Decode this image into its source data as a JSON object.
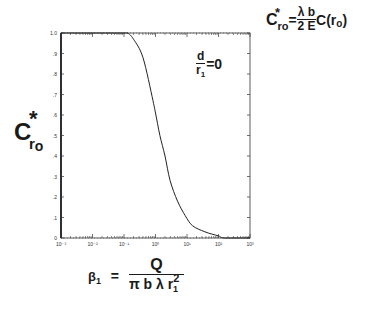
{
  "chart_data": {
    "type": "line",
    "title": "",
    "xlabel": "β₁ = Q / (π b λ r₁²)",
    "ylabel": "C*r₀",
    "xscale": "log",
    "xlim": [
      0.001,
      1000
    ],
    "ylim": [
      0,
      1.0
    ],
    "x_tick_labels": [
      "10⁻³",
      "10⁻²",
      "10⁻¹",
      "10⁰",
      "10¹",
      "10²",
      "10³"
    ],
    "y_tick_labels": [
      "0",
      ".1",
      ".2",
      ".3",
      ".4",
      ".5",
      ".6",
      ".7",
      ".8",
      ".9",
      "1.0"
    ],
    "grid": false,
    "legend": null,
    "annotations": [
      "d/r₁ = 0",
      "C*r₀ = (λ b / 2 E) C(r₀)"
    ],
    "series": [
      {
        "name": "d/r1 = 0",
        "x": [
          0.001,
          0.01,
          0.1,
          0.13,
          0.2,
          0.4,
          0.83,
          1.0,
          1.38,
          2.0,
          2.9,
          5.0,
          8.7,
          15,
          37,
          100,
          160,
          1000
        ],
        "y": [
          1.0,
          1.0,
          1.0,
          1.0,
          0.97,
          0.88,
          0.67,
          0.61,
          0.5,
          0.4,
          0.28,
          0.18,
          0.11,
          0.06,
          0.03,
          0.01,
          0.0,
          0.0
        ]
      }
    ]
  },
  "labels": {
    "y_axis_main": "C",
    "y_axis_star": "*",
    "y_axis_sub": "r",
    "y_axis_subsub": "o",
    "curve_param_num": "d",
    "curve_param_den": "r",
    "curve_param_den_sub": "1",
    "curve_param_eq": "=0",
    "top_formula_lhs": "C",
    "top_formula_star": "*",
    "top_formula_sub": "ro",
    "top_formula_eq": "=",
    "top_formula_num": "λ b",
    "top_formula_den": "2 E",
    "top_formula_tail": "C(r",
    "top_formula_tail_sub": "o",
    "top_formula_tail_close": ")",
    "bottom_formula_lhs": "β",
    "bottom_formula_lhs_sub": "1",
    "bottom_formula_eq": "=",
    "bottom_formula_num": "Q",
    "bottom_formula_den": "π  b λ r",
    "bottom_formula_den_sub": "1",
    "bottom_formula_den_sup": "2"
  }
}
